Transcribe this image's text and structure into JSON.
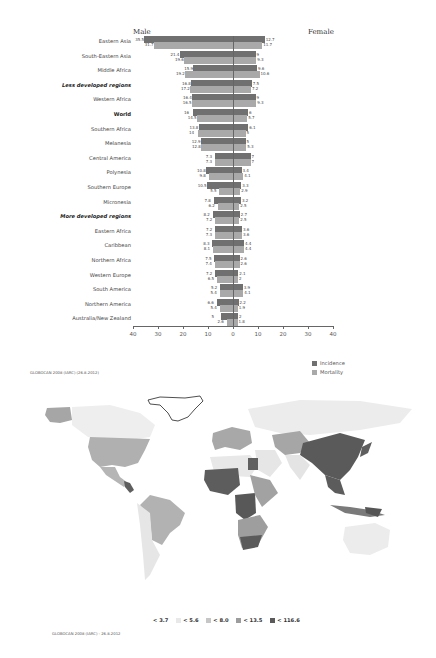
{
  "chart_data": [
    {
      "type": "bar",
      "orientation": "horizontal-population-pyramid",
      "title": "",
      "left_label": "Male",
      "right_label": "Female",
      "xlabel": "",
      "ylabel": "",
      "xlim": [
        -40,
        40
      ],
      "x_ticks": [
        "40",
        "30",
        "20",
        "10",
        "0",
        "10",
        "20",
        "30",
        "40"
      ],
      "legend": [
        {
          "name": "Incidence",
          "color": "#707070"
        },
        {
          "name": "Mortality",
          "color": "#a9a9a9"
        }
      ],
      "legend_position": "bottom-right",
      "categories": [
        "Eastern Asia",
        "South-Eastern Asia",
        "Middle Africa",
        "Less developed regions",
        "Western Africa",
        "World",
        "Southern Africa",
        "Melanesia",
        "Central America",
        "Polynesia",
        "Southern Europe",
        "Micronesia",
        "More developed regions",
        "Eastern Africa",
        "Caribbean",
        "Northern Africa",
        "Western Europe",
        "South America",
        "Northern America",
        "Australia/New Zealand"
      ],
      "series": [
        {
          "name": "Male Incidence",
          "values": [
            35.5,
            21.4,
            15.9,
            16.8,
            16.4,
            16,
            13.8,
            12.9,
            7.3,
            10.8,
            10.5,
            7.8,
            8.2,
            7.2,
            8.3,
            7.5,
            7.2,
            5.2,
            6.6,
            5
          ]
        },
        {
          "name": "Male Mortality",
          "values": [
            31.7,
            19.6,
            19.2,
            17.2,
            16.5,
            14.5,
            14,
            12.8,
            7.3,
            9.8,
            5.5,
            6.2,
            7.2,
            7.3,
            8.1,
            7.4,
            6.5,
            5.4,
            5.4,
            2.6
          ]
        },
        {
          "name": "Female Incidence",
          "values": [
            12.7,
            9,
            9.6,
            7.5,
            9,
            6,
            6.1,
            5,
            7,
            3.4,
            3.3,
            3.2,
            2.7,
            3.6,
            4.4,
            2.6,
            2.1,
            3.9,
            2.2,
            2
          ]
        },
        {
          "name": "Female Mortality",
          "values": [
            11.7,
            9.3,
            10.6,
            7.2,
            9.3,
            5.7,
            5,
            5.3,
            7,
            4.1,
            2.9,
            2.5,
            2.5,
            3.6,
            4.4,
            2.6,
            2,
            4.1,
            1.9,
            1.8
          ]
        }
      ],
      "bold_categories": [
        "Less developed regions",
        "World",
        "More developed regions"
      ],
      "credit": "GLOBOCAN 2008 (IARC) (26.8.2012)"
    },
    {
      "type": "heatmap",
      "subtype": "choropleth-world-map",
      "legend": [
        {
          "label": "< 3.7",
          "color": "#f4f4f4"
        },
        {
          "label": "< 5.6",
          "color": "#e3e3e3"
        },
        {
          "label": "< 8.0",
          "color": "#c6c6c6"
        },
        {
          "label": "< 13.5",
          "color": "#a0a0a0"
        },
        {
          "label": "< 116.6",
          "color": "#5a5a5a"
        }
      ],
      "credit": "GLOBOCAN 2008 (IARC) - 26.8.2012"
    }
  ],
  "pyramid": {
    "male_label": "Male",
    "female_label": "Female",
    "credit": "GLOBOCAN 2008 (IARC) (26.8.2012)",
    "legend": {
      "incidence": "Incidence",
      "mortality": "Mortality"
    }
  },
  "map": {
    "credit": "GLOBOCAN 2008 (IARC) - 26.8.2012",
    "legend": [
      "< 3.7",
      "< 5.6",
      "< 8.0",
      "< 13.5",
      "< 116.6"
    ]
  }
}
